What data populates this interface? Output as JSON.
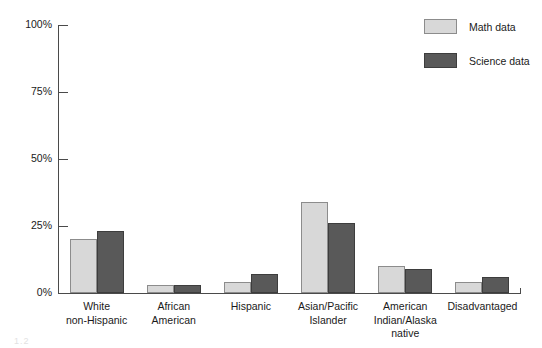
{
  "chart_data": {
    "type": "bar",
    "title": "",
    "xlabel": "",
    "ylabel": "",
    "ylim": [
      0,
      100
    ],
    "yticks": [
      "0%",
      "25%",
      "50%",
      "75%",
      "100%"
    ],
    "ytick_values": [
      0,
      25,
      50,
      75,
      100
    ],
    "grid": false,
    "legend_position": "top-right",
    "categories": [
      "White\nnon-Hispanic",
      "African\nAmerican",
      "Hispanic",
      "Asian/Pacific\nIslander",
      "American\nIndian/Alaska\nnative",
      "Disadvantaged"
    ],
    "series": [
      {
        "name": "Math data",
        "color": "#d8d8d8",
        "values": [
          20,
          3,
          4,
          34,
          10,
          4
        ]
      },
      {
        "name": "Science data",
        "color": "#595959",
        "values": [
          23,
          3,
          7,
          26,
          9,
          6
        ]
      }
    ]
  },
  "legend": {
    "items": [
      {
        "label": "Math data",
        "swatch": "math"
      },
      {
        "label": "Science data",
        "swatch": "science"
      }
    ]
  },
  "artifact": {
    "text": "1.2"
  }
}
